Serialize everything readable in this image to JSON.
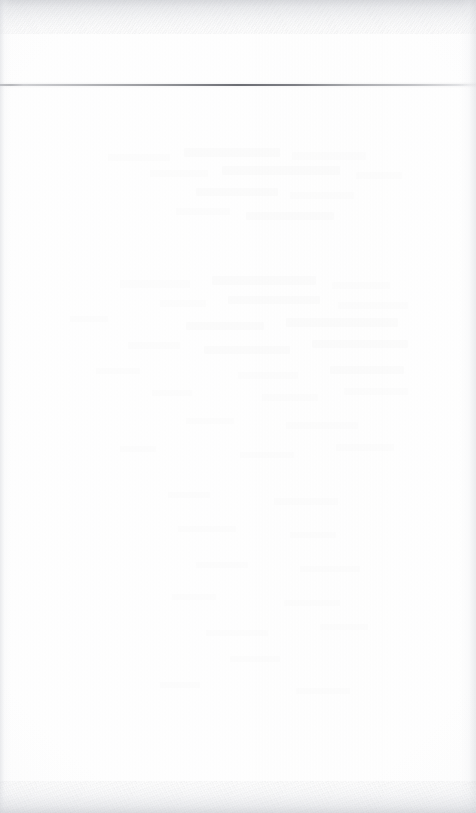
{
  "document": {
    "kind": "scanned-page",
    "page_state": "blank",
    "body_text": "",
    "header_text": "",
    "footer_text": "",
    "page_number": "",
    "visible_text_items": []
  },
  "canvas": {
    "width_px": 476,
    "height_px": 813,
    "paper_color": "#fefefe",
    "background_color": "#ffffff"
  },
  "header_rule": {
    "label": "",
    "y_px": 84,
    "thickness_px": 2,
    "x_start_px": 0,
    "x_end_px": 476,
    "color": "#56585f",
    "description": ""
  },
  "edges": {
    "top_band": {
      "height_px": 34,
      "color": "#cdcfd4"
    },
    "bottom_band": {
      "height_px": 32,
      "color": "#d0d2d7"
    },
    "left_band": {
      "width_px": 11,
      "color": "#d6d8dd"
    },
    "right_band": {
      "width_px": 16,
      "color": "#d4d6db"
    }
  },
  "ghost_marks": [
    {
      "x": 108,
      "y": 58,
      "w": 62,
      "h": 7,
      "tone": "fainter"
    },
    {
      "x": 184,
      "y": 52,
      "w": 96,
      "h": 9,
      "tone": "soft"
    },
    {
      "x": 292,
      "y": 56,
      "w": 74,
      "h": 8,
      "tone": "fainter"
    },
    {
      "x": 150,
      "y": 74,
      "w": 58,
      "h": 7,
      "tone": "fainter"
    },
    {
      "x": 222,
      "y": 70,
      "w": 118,
      "h": 9,
      "tone": "soft"
    },
    {
      "x": 356,
      "y": 76,
      "w": 46,
      "h": 7,
      "tone": "fainter"
    },
    {
      "x": 196,
      "y": 92,
      "w": 82,
      "h": 8,
      "tone": "soft"
    },
    {
      "x": 290,
      "y": 96,
      "w": 64,
      "h": 7,
      "tone": "fainter"
    },
    {
      "x": 176,
      "y": 112,
      "w": 54,
      "h": 7,
      "tone": "fainter"
    },
    {
      "x": 246,
      "y": 116,
      "w": 88,
      "h": 8,
      "tone": "soft"
    },
    {
      "x": 120,
      "y": 184,
      "w": 70,
      "h": 8,
      "tone": "fainter"
    },
    {
      "x": 212,
      "y": 180,
      "w": 104,
      "h": 9,
      "tone": "soft"
    },
    {
      "x": 332,
      "y": 186,
      "w": 58,
      "h": 7,
      "tone": "fainter"
    },
    {
      "x": 160,
      "y": 204,
      "w": 46,
      "h": 7,
      "tone": "fainter"
    },
    {
      "x": 228,
      "y": 200,
      "w": 92,
      "h": 8,
      "tone": "soft"
    },
    {
      "x": 338,
      "y": 206,
      "w": 70,
      "h": 7,
      "tone": "fainter"
    },
    {
      "x": 70,
      "y": 220,
      "w": 38,
      "h": 6,
      "tone": "fainter"
    },
    {
      "x": 186,
      "y": 226,
      "w": 78,
      "h": 8,
      "tone": "soft"
    },
    {
      "x": 286,
      "y": 222,
      "w": 112,
      "h": 9,
      "tone": "soft"
    },
    {
      "x": 128,
      "y": 246,
      "w": 52,
      "h": 7,
      "tone": "fainter"
    },
    {
      "x": 204,
      "y": 250,
      "w": 86,
      "h": 8,
      "tone": "soft"
    },
    {
      "x": 312,
      "y": 244,
      "w": 96,
      "h": 8,
      "tone": "soft"
    },
    {
      "x": 96,
      "y": 272,
      "w": 44,
      "h": 6,
      "tone": "fainter"
    },
    {
      "x": 238,
      "y": 276,
      "w": 60,
      "h": 7,
      "tone": "fainter"
    },
    {
      "x": 330,
      "y": 270,
      "w": 74,
      "h": 8,
      "tone": "soft"
    },
    {
      "x": 152,
      "y": 294,
      "w": 40,
      "h": 6,
      "tone": "fainter"
    },
    {
      "x": 262,
      "y": 298,
      "w": 56,
      "h": 7,
      "tone": "fainter"
    },
    {
      "x": 344,
      "y": 292,
      "w": 64,
      "h": 7,
      "tone": "fainter"
    },
    {
      "x": 186,
      "y": 322,
      "w": 48,
      "h": 6,
      "tone": "fainter"
    },
    {
      "x": 286,
      "y": 326,
      "w": 72,
      "h": 7,
      "tone": "fainter"
    },
    {
      "x": 120,
      "y": 350,
      "w": 36,
      "h": 6,
      "tone": "fainter"
    },
    {
      "x": 240,
      "y": 356,
      "w": 54,
      "h": 6,
      "tone": "fainter"
    },
    {
      "x": 336,
      "y": 348,
      "w": 58,
      "h": 7,
      "tone": "fainter"
    },
    {
      "x": 168,
      "y": 396,
      "w": 42,
      "h": 6,
      "tone": "fainter"
    },
    {
      "x": 274,
      "y": 402,
      "w": 64,
      "h": 7,
      "tone": "fainter"
    },
    {
      "x": 178,
      "y": 430,
      "w": 58,
      "h": 6,
      "tone": "fainter"
    },
    {
      "x": 290,
      "y": 436,
      "w": 46,
      "h": 6,
      "tone": "fainter"
    },
    {
      "x": 196,
      "y": 466,
      "w": 52,
      "h": 6,
      "tone": "fainter"
    },
    {
      "x": 300,
      "y": 470,
      "w": 60,
      "h": 6,
      "tone": "fainter"
    },
    {
      "x": 172,
      "y": 498,
      "w": 44,
      "h": 6,
      "tone": "fainter"
    },
    {
      "x": 284,
      "y": 504,
      "w": 56,
      "h": 6,
      "tone": "fainter"
    },
    {
      "x": 206,
      "y": 534,
      "w": 62,
      "h": 6,
      "tone": "fainter"
    },
    {
      "x": 320,
      "y": 528,
      "w": 48,
      "h": 6,
      "tone": "fainter"
    },
    {
      "x": 230,
      "y": 560,
      "w": 50,
      "h": 6,
      "tone": "fainter"
    },
    {
      "x": 160,
      "y": 586,
      "w": 40,
      "h": 6,
      "tone": "fainter"
    },
    {
      "x": 296,
      "y": 592,
      "w": 54,
      "h": 6,
      "tone": "fainter"
    }
  ]
}
